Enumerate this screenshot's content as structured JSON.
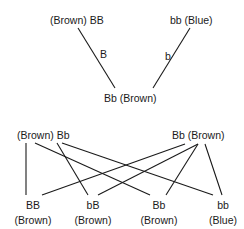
{
  "cross1": {
    "parent_left": "(Brown) BB",
    "parent_right": "bb (Blue)",
    "gamete_left": "B",
    "gamete_right": "b",
    "offspring": "Bb (Brown)"
  },
  "cross2": {
    "parent_left": "(Brown) Bb",
    "parent_right": "Bb (Brown)",
    "offspring": [
      {
        "genotype": "BB",
        "phenotype": "(Brown)"
      },
      {
        "genotype": "bB",
        "phenotype": "(Brown)"
      },
      {
        "genotype": "Bb",
        "phenotype": "(Brown)"
      },
      {
        "genotype": "bb",
        "phenotype": "(Blue)"
      }
    ]
  }
}
